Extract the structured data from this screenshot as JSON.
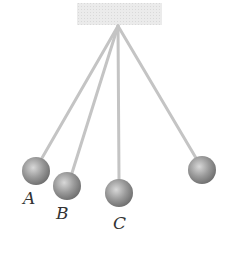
{
  "diagram": {
    "type": "pendulums",
    "support": {
      "x": 77,
      "y": 3,
      "width": 85,
      "height": 22,
      "color": "#e6e6e6"
    },
    "pivot": {
      "x": 118,
      "y": 26
    },
    "string_color": "#c8c8c8",
    "bobs": [
      {
        "id": "A",
        "label": "A",
        "cx": 36,
        "cy": 171,
        "r": 14,
        "label_x": 28,
        "label_y": 204
      },
      {
        "id": "B",
        "label": "B",
        "cx": 67,
        "cy": 186,
        "r": 14,
        "label_x": 61,
        "label_y": 219
      },
      {
        "id": "C",
        "label": "C",
        "cx": 119,
        "cy": 193,
        "r": 14,
        "label_x": 119,
        "label_y": 229
      },
      {
        "id": "D",
        "label": "",
        "cx": 202,
        "cy": 170,
        "r": 14,
        "label_x": 0,
        "label_y": 0
      }
    ]
  }
}
